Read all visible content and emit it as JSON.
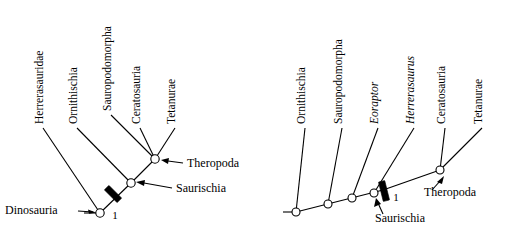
{
  "figure": {
    "title": "",
    "panels": [
      {
        "id": "panel-left",
        "taxa": [
          {
            "name": "Herrerasauridae",
            "italic": false
          },
          {
            "name": "Ornithischia",
            "italic": false
          },
          {
            "name": "Sauropodomorpha",
            "italic": false
          },
          {
            "name": "Ceratosauria",
            "italic": false
          },
          {
            "name": "Tetanurae",
            "italic": false
          }
        ],
        "node_labels": [
          {
            "name": "Dinosauria"
          },
          {
            "name": "Saurischia"
          },
          {
            "name": "Theropoda"
          }
        ],
        "node_numbers": [
          "1"
        ]
      },
      {
        "id": "panel-right",
        "taxa": [
          {
            "name": "Ornithischia",
            "italic": false
          },
          {
            "name": "Sauropodomorpha",
            "italic": false
          },
          {
            "name": "Eoraptor",
            "italic": true
          },
          {
            "name": "Herrerasaurus",
            "italic": true
          },
          {
            "name": "Ceratosauria",
            "italic": false
          },
          {
            "name": "Tetanurae",
            "italic": false
          }
        ],
        "node_labels": [
          {
            "name": "Saurischia"
          },
          {
            "name": "Theropoda"
          }
        ],
        "node_numbers": [
          "1"
        ]
      }
    ],
    "colors": {
      "background": "#ffffff",
      "lines": "#000000",
      "node_fill": "#ffffff",
      "bar_fill": "#000000"
    }
  }
}
